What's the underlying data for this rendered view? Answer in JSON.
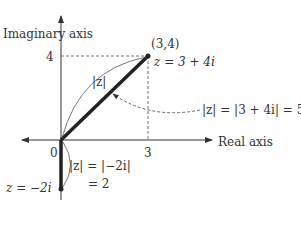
{
  "diagram": {
    "axes": {
      "y_label": "Imaginary axis",
      "x_label": "Real axis",
      "origin_label": "0",
      "x_tick": "3",
      "y_tick": "4"
    },
    "point_a": {
      "coords_label": "(3,4)",
      "equation": "z = 3 + 4i",
      "segment_label": "|z|",
      "modulus_annotation": "|z| = |3 + 4i| = 5"
    },
    "point_b": {
      "equation": "z = −2i",
      "modulus_line1": "|z| = |−2i|",
      "modulus_line2": "= 2"
    },
    "colors": {
      "ink": "#333333",
      "guide": "#777777"
    }
  }
}
